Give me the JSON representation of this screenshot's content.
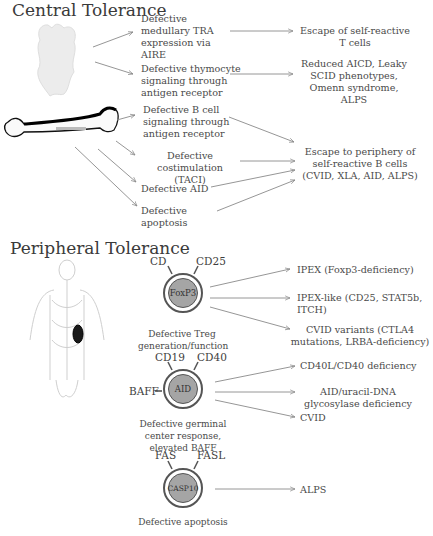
{
  "central": {
    "title": "Central Tolerance",
    "causes": {
      "aire": "Defective medullary TRA expression via AIRE",
      "thymocyte": "Defective thymocyte signaling through antigen receptor",
      "bcell": "Defective B cell signaling through antigen receptor",
      "costim": "Defective costimulation (TACI)",
      "aid": "Defective AID",
      "apoptosis": "Defective apoptosis"
    },
    "outcomes": {
      "tcells": "Escape of self-reactive T cells",
      "aicd": "Reduced AICD, Leaky SCID phenotypes, Omenn syndrome, ALPS",
      "bcells": "Escape to periphery of self-reactive B cells (CVID, XLA, AID, ALPS)"
    },
    "organs": [
      "thymus-illustration",
      "bone-marrow-femur-illustration"
    ]
  },
  "peripheral": {
    "title": "Peripheral Tolerance",
    "organ": "lymphatic-system-body-illustration",
    "treg": {
      "receptor_left": "CD",
      "receptor_right": "CD25",
      "core": "FoxP3",
      "caption": "Defective Treg generation/function",
      "outcomes": [
        "IPEX (Foxp3-deficiency)",
        "IPEX-like (CD25, STAT5b, ITCH)",
        "CVID variants (CTLA4 mutations, LRBA-deficiency)"
      ]
    },
    "gc": {
      "receptor_left": "CD19",
      "receptor_right": "CD40",
      "receptor_side": "BAFF",
      "core": "AID",
      "caption": "Defective germinal center response, elevated BAFF",
      "outcomes": [
        "CD40L/CD40 deficiency",
        "AID/uracil-DNA glycosylase deficiency",
        "CVID"
      ]
    },
    "apop": {
      "receptor_left": "FAS",
      "receptor_right": "FASL",
      "core": "CASP10",
      "caption": "Defective apoptosis",
      "outcomes": [
        "ALPS"
      ]
    }
  },
  "colors": {
    "text": "#444444",
    "arrow": "#8a8a8a",
    "cell_core": "#a5a5a5",
    "cell_ring": "#555555"
  }
}
